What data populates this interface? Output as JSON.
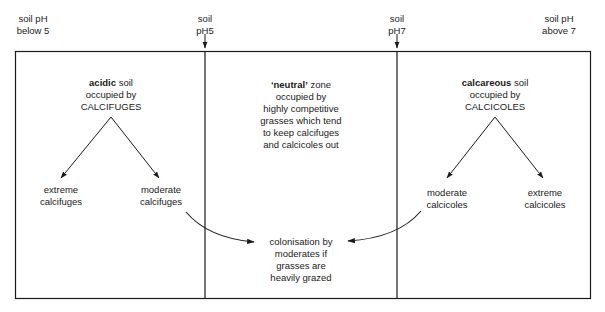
{
  "header_labels": {
    "ph_below_5": [
      "soil pH",
      "below 5"
    ],
    "ph_5": [
      "soil",
      "pH5"
    ],
    "ph_7": [
      "soil",
      "pH7"
    ],
    "ph_above_7": [
      "soil pH",
      "above 7"
    ]
  },
  "zones": {
    "acidic": {
      "title_bold": "acidic",
      "title_rest": " soil",
      "line2": "occupied by",
      "line3": "CALCIFUGES",
      "branch_left": [
        "extreme",
        "calcifuges"
      ],
      "branch_right": [
        "moderate",
        "calcifuges"
      ]
    },
    "neutral": {
      "title_bold": "‘neutral’",
      "title_rest": " zone",
      "lines": [
        "occupied by",
        "highly competitive",
        "grasses which tend",
        "to keep calcifuges",
        "and calcicoles out"
      ],
      "colonisation": [
        "colonisation by",
        "moderates if",
        "grasses are",
        "heavily grazed"
      ]
    },
    "calcareous": {
      "title_bold": "calcareous",
      "title_rest": " soil",
      "line2": "occupied by",
      "line3": "CALCICOLES",
      "branch_left": [
        "moderate",
        "calcicoles"
      ],
      "branch_right": [
        "extreme",
        "calcicoles"
      ]
    }
  },
  "colors": {
    "line": "#1a1a1a",
    "background": "#ffffff"
  }
}
